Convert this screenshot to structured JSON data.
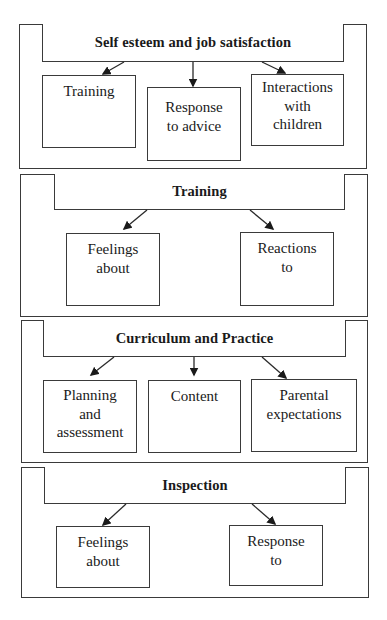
{
  "diagram": {
    "panels": [
      {
        "title": "Self esteem and job satisfaction",
        "children": [
          {
            "lines": [
              "Training"
            ]
          },
          {
            "lines": [
              "Response",
              "to advice"
            ]
          },
          {
            "lines": [
              "Interactions",
              "with",
              "children"
            ]
          }
        ]
      },
      {
        "title": "Training",
        "children": [
          {
            "lines": [
              "Feelings",
              "about"
            ]
          },
          {
            "lines": [
              "Reactions",
              "to"
            ]
          }
        ]
      },
      {
        "title": "Curriculum and Practice",
        "children": [
          {
            "lines": [
              "Planning",
              "and",
              "assessment"
            ]
          },
          {
            "lines": [
              "Content"
            ]
          },
          {
            "lines": [
              "Parental",
              "expectations"
            ]
          }
        ]
      },
      {
        "title": "Inspection",
        "children": [
          {
            "lines": [
              "Feelings",
              "about"
            ]
          },
          {
            "lines": [
              "Response",
              "to"
            ]
          }
        ]
      }
    ],
    "colors": {
      "line": "#3a3a3a",
      "text": "#1a1a1a",
      "background": "#ffffff"
    }
  }
}
